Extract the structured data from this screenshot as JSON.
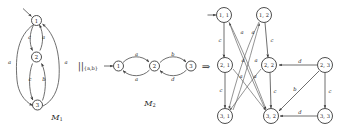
{
  "figure": {
    "operator": "||",
    "operator_subscript": "{a,b}",
    "implies_symbol": "⇒",
    "machines": [
      {
        "name": "M",
        "subscript": "1",
        "label_full": "M₁",
        "initial_state": "1",
        "states": [
          "1",
          "2",
          "3"
        ],
        "transitions": [
          {
            "from": "1",
            "to": "2",
            "label": "c"
          },
          {
            "from": "2",
            "to": "1",
            "label": "a"
          },
          {
            "from": "2",
            "to": "3",
            "label": "c"
          },
          {
            "from": "3",
            "to": "2",
            "label": "b"
          },
          {
            "from": "1",
            "to": "3",
            "label": "a"
          },
          {
            "from": "3",
            "to": "1",
            "label": "a"
          }
        ]
      },
      {
        "name": "M",
        "subscript": "2",
        "label_full": "M₂",
        "initial_state": "1",
        "states": [
          "1",
          "2",
          "3"
        ],
        "transitions": [
          {
            "from": "1",
            "to": "2",
            "label": "a"
          },
          {
            "from": "2",
            "to": "1",
            "label": "a"
          },
          {
            "from": "2",
            "to": "3",
            "label": "b"
          },
          {
            "from": "3",
            "to": "2",
            "label": "d"
          }
        ]
      }
    ],
    "product": {
      "initial_state": "1, 1",
      "states": [
        {
          "id": "11",
          "label": "1, 1"
        },
        {
          "id": "12",
          "label": "1, 2"
        },
        {
          "id": "21",
          "label": "2, 1"
        },
        {
          "id": "22",
          "label": "2, 2"
        },
        {
          "id": "23",
          "label": "2, 3"
        },
        {
          "id": "31",
          "label": "3, 1"
        },
        {
          "id": "32",
          "label": "3, 2"
        },
        {
          "id": "33",
          "label": "3, 3"
        }
      ],
      "transitions": [
        {
          "from": "1, 1",
          "to": "2, 1",
          "label": "c"
        },
        {
          "from": "1, 2",
          "to": "2, 2",
          "label": "c"
        },
        {
          "from": "2, 1",
          "to": "3, 1",
          "label": "c"
        },
        {
          "from": "2, 2",
          "to": "3, 2",
          "label": "c"
        },
        {
          "from": "2, 3",
          "to": "3, 3",
          "label": "c"
        },
        {
          "from": "2, 3",
          "to": "2, 2",
          "label": "d"
        },
        {
          "from": "3, 3",
          "to": "3, 2",
          "label": "d"
        },
        {
          "from": "2, 3",
          "to": "3, 2",
          "label": "b"
        },
        {
          "from": "1, 2",
          "to": "3, 1",
          "label": "a"
        },
        {
          "from": "1, 1",
          "to": "3, 2",
          "label": "a"
        },
        {
          "from": "3, 1",
          "to": "1, 2",
          "label": "a"
        },
        {
          "from": "3, 2",
          "to": "1, 1",
          "label": "a"
        },
        {
          "from": "2, 1",
          "to": "3, 2",
          "label": "a"
        },
        {
          "from": "2, 2",
          "to": "3, 1",
          "label": "a"
        }
      ],
      "edge_label_alphabet": [
        "a",
        "b",
        "c",
        "d"
      ]
    }
  }
}
